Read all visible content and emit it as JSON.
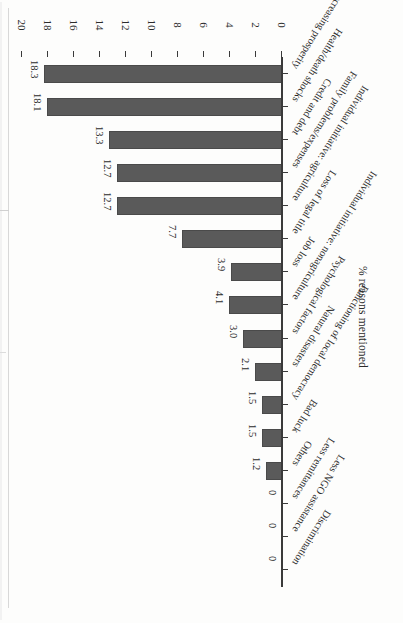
{
  "figure": {
    "rotation_degrees": 180,
    "background_color": "#fdfdfc",
    "bar_color": "#5a5a5a",
    "axis_color": "#3a3a3a"
  },
  "chart_data": {
    "type": "bar",
    "orientation": "vertical-bars-rendered-as-rotated-page",
    "title": "",
    "xlabel": "",
    "ylabel": "% reasons mentioned",
    "ylim": [
      0,
      20
    ],
    "grid": false,
    "legend": "none",
    "tick_labels": [
      "0",
      "2",
      "4",
      "6",
      "8",
      "10",
      "12",
      "14",
      "16",
      "18",
      "20"
    ],
    "tick_values": [
      0,
      2,
      4,
      6,
      8,
      10,
      12,
      14,
      16,
      18,
      20
    ],
    "categories": [
      "Decreasing prosperity",
      "Health/death shocks",
      "Credit and debt",
      "Family problems/expenses",
      "Individual initiative: agriculture",
      "Loss of legal title",
      "Job loss",
      "Individual initiative: nonagriculture",
      "Psychological factors",
      "Natural disasters",
      "Functioning of local democracy",
      "Bad luck",
      "Others",
      "Less remittances",
      "Less NGO assistance",
      "Discrimination"
    ],
    "values": [
      18.3,
      18.1,
      13.3,
      12.7,
      12.7,
      7.7,
      3.9,
      4.1,
      3.0,
      2.1,
      1.5,
      1.5,
      1.2,
      0,
      0,
      0
    ],
    "data_labels": [
      "18.3",
      "18.1",
      "13.3",
      "12.7",
      "12.7",
      "7.7",
      "3.9",
      "4.1",
      "3.0",
      "2.1",
      "1.5",
      "1.5",
      "1.2",
      "0",
      "0",
      "0"
    ]
  }
}
